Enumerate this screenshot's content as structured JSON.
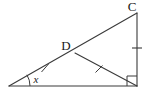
{
  "figure": {
    "width": 151,
    "height": 95,
    "background_color": "#ffffff",
    "stroke_color": "#3a3a3a",
    "label_color": "#1a1a1a",
    "stroke_width": 1.1
  },
  "labels": {
    "vertex_c": "C",
    "vertex_d": "D",
    "angle_x": "x"
  },
  "points": {
    "A": {
      "x": 9,
      "y": 86
    },
    "B": {
      "x": 137,
      "y": 86
    },
    "C": {
      "x": 137,
      "y": 13
    },
    "D": {
      "x": 75,
      "y": 53
    }
  },
  "segments": [
    {
      "name": "base-AB",
      "from": "A",
      "to": "B"
    },
    {
      "name": "hypotenuse-AC",
      "from": "A",
      "to": "C"
    },
    {
      "name": "vertical-CB",
      "from": "C",
      "to": "B"
    },
    {
      "name": "cevian-DB",
      "from": "D",
      "to": "B"
    }
  ],
  "tick_marks": [
    {
      "name": "tick-on-AD",
      "segment": "hypotenuse-AC",
      "count": 1,
      "style": "single-slash",
      "x": 45,
      "y": 68
    },
    {
      "name": "tick-on-DB",
      "segment": "cevian-DB",
      "count": 1,
      "style": "single-slash",
      "x": 99,
      "y": 69
    },
    {
      "name": "tick-on-CB",
      "segment": "vertical-CB",
      "count": 1,
      "style": "single-dash",
      "x": 137,
      "y": 48
    }
  ],
  "markers": {
    "right_angle": {
      "name": "right-angle-at-B",
      "vertex": "B",
      "size": 10
    },
    "angle_arc": {
      "name": "angle-arc-at-A",
      "vertex": "A",
      "radius": 21
    }
  },
  "label_positions": {
    "vertex_c": {
      "x": 132,
      "y": 11
    },
    "vertex_d": {
      "x": 62,
      "y": 50
    },
    "angle_x": {
      "x": 36,
      "y": 83
    }
  }
}
